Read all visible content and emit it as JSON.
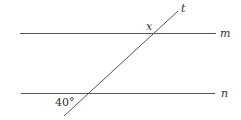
{
  "diagram": {
    "type": "parallel-lines-transversal",
    "lines": {
      "m": {
        "label": "m",
        "x1": 20,
        "y1": 33.5,
        "x2": 216,
        "y2": 33.5
      },
      "n": {
        "label": "n",
        "x1": 21,
        "y1": 93.5,
        "x2": 215,
        "y2": 93.5
      },
      "t": {
        "label": "t",
        "x1": 64,
        "y1": 116,
        "x2": 178,
        "y2": 11
      }
    },
    "angle_labels": {
      "x": "x",
      "given": "40°"
    },
    "colors": {
      "line": "#555555",
      "text": "#333333",
      "background": "#ffffff"
    }
  }
}
